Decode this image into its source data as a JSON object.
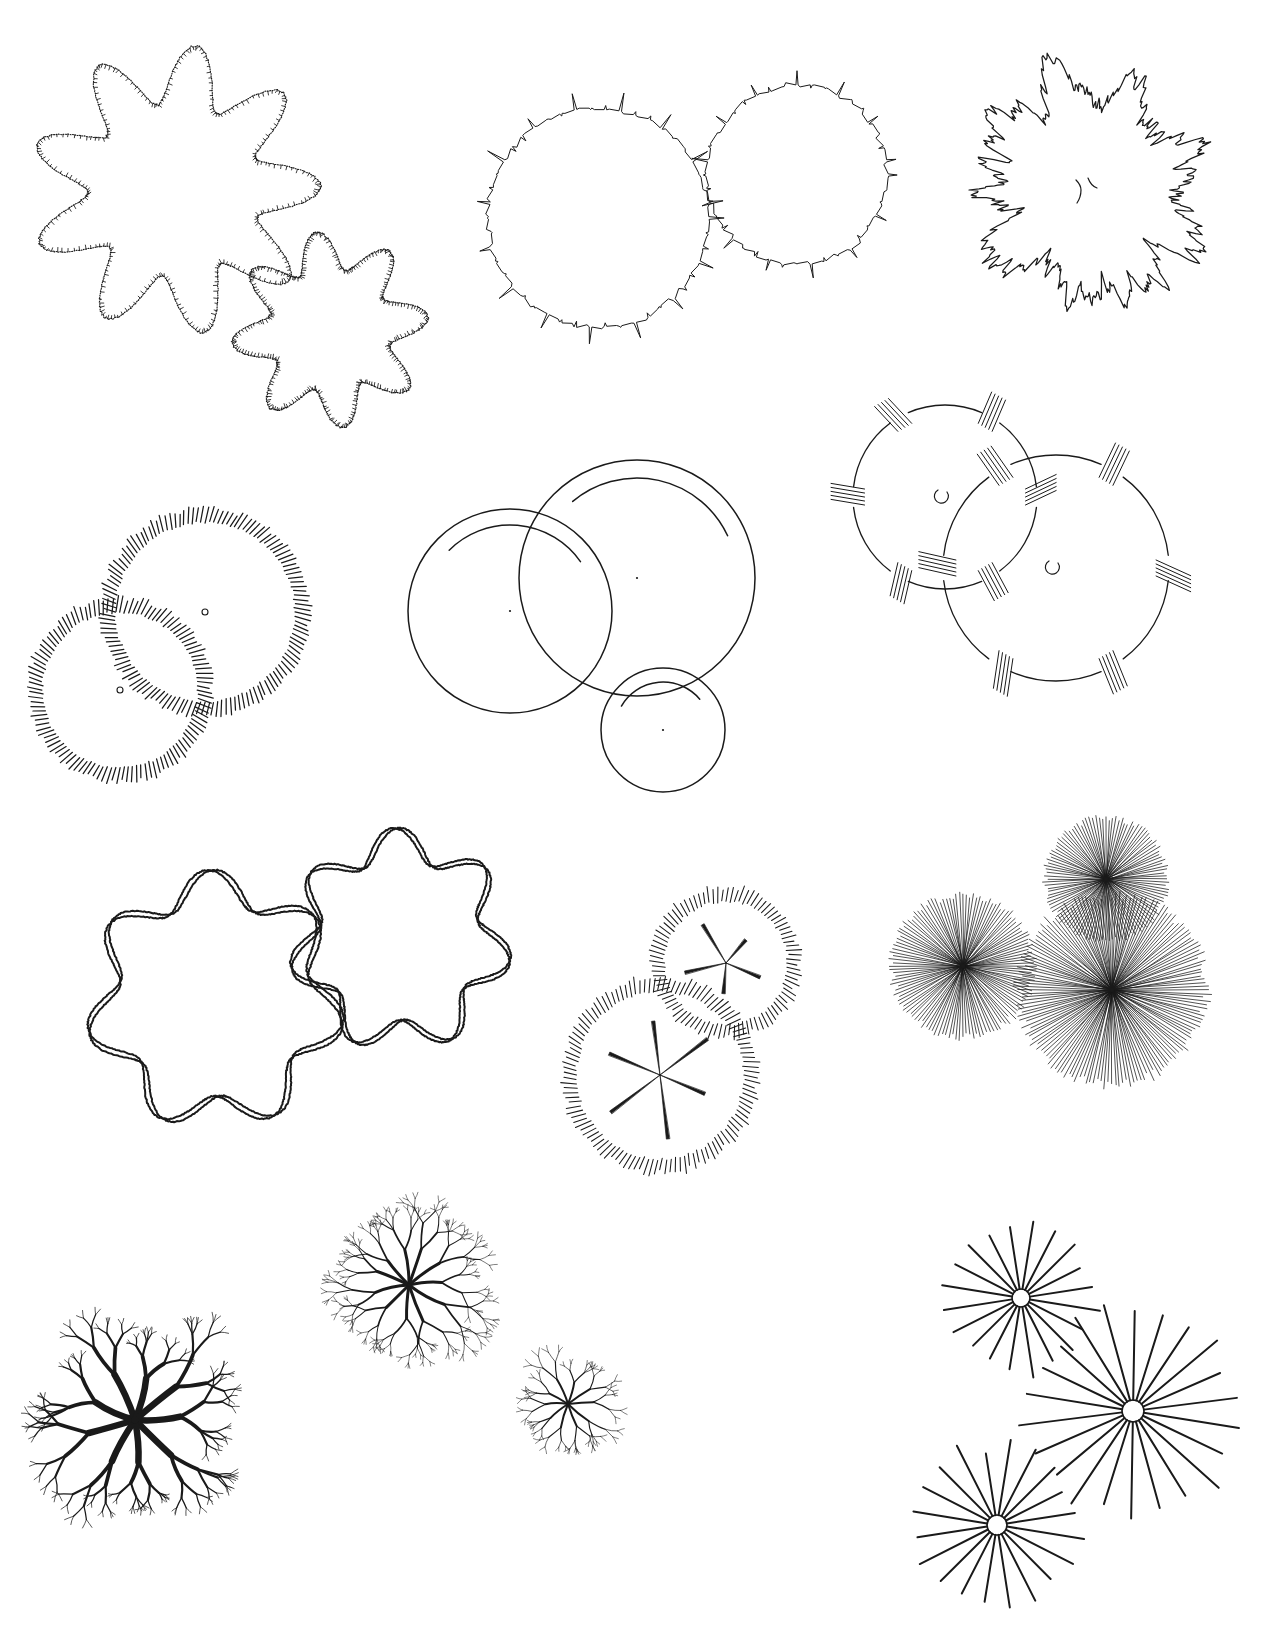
{
  "sheet": {
    "title": "Tree Symbols in Plan",
    "background_color": "#ffffff",
    "ink_color": "#1a1a1a",
    "width": 1275,
    "height": 1636,
    "footer_note": ""
  },
  "symbols": [
    {
      "id": "scalloped-stippled-cloud",
      "name": "Scalloped stippled canopy pair",
      "style": "stippled-scallop",
      "row": 1,
      "column": 1,
      "canopies": [
        {
          "cx": 175,
          "cy": 190,
          "r": 135,
          "lobes": 9,
          "lobe_depth": 0.14,
          "phase": 0.25
        },
        {
          "cx": 330,
          "cy": 330,
          "r": 92,
          "lobes": 8,
          "lobe_depth": 0.13,
          "phase": 1.1
        }
      ]
    },
    {
      "id": "spiky-jagged-canopy",
      "name": "Spiky jagged canopy pair",
      "style": "spiky",
      "row": 1,
      "column": 2,
      "canopies": [
        {
          "cx": 598,
          "cy": 218,
          "r": 110,
          "spikes": 46,
          "spike_len": 20,
          "jitter": 5
        },
        {
          "cx": 797,
          "cy": 175,
          "r": 90,
          "spikes": 40,
          "spike_len": 17,
          "jitter": 5
        }
      ]
    },
    {
      "id": "fractal-lobed-canopy",
      "name": "Fractal lobed canopy with trunk mark",
      "style": "fractal-outline",
      "row": 1,
      "column": 3,
      "canopies": [
        {
          "cx": 1087,
          "cy": 190,
          "r": 118,
          "lobes": 9,
          "lobe_depth": 0.3,
          "roughness": 4,
          "trunk_mark": true
        }
      ]
    },
    {
      "id": "comb-fringe-canopy",
      "name": "Comb fringe canopy pair with center dots",
      "style": "comb-fringe",
      "row": 2,
      "column": 1,
      "canopies": [
        {
          "cx": 205,
          "cy": 612,
          "r": 90,
          "ticks": 132,
          "tick_len": 14,
          "center_dot": true
        },
        {
          "cx": 120,
          "cy": 690,
          "r": 78,
          "ticks": 116,
          "tick_len": 14,
          "center_dot": true
        }
      ]
    },
    {
      "id": "plain-circle-shadow-arc",
      "name": "Plain circles with offset shade arc",
      "style": "plain-circle",
      "row": 2,
      "column": 2,
      "canopies": [
        {
          "cx": 510,
          "cy": 611,
          "r": 102,
          "center_dot": true,
          "arc_offset": 16,
          "arc_start": -135,
          "arc_end": -35
        },
        {
          "cx": 637,
          "cy": 578,
          "r": 118,
          "center_dot": true,
          "arc_offset": 18,
          "arc_start": -130,
          "arc_end": -25
        },
        {
          "cx": 663,
          "cy": 730,
          "r": 62,
          "center_dot": true,
          "arc_offset": 14,
          "arc_start": -150,
          "arc_end": -40
        }
      ]
    },
    {
      "id": "broken-arc-hatch-cluster",
      "name": "Broken arc canopy with hatch clusters",
      "style": "broken-arc-hatch",
      "row": 2,
      "column": 3,
      "canopies": [
        {
          "cx": 945,
          "cy": 497,
          "r": 92,
          "segments": 6,
          "cluster_lines": 5,
          "cluster_len": 34,
          "trunk_mark": true
        },
        {
          "cx": 1056,
          "cy": 568,
          "r": 113,
          "segments": 6,
          "cluster_lines": 5,
          "cluster_len": 38,
          "trunk_mark": true
        }
      ]
    },
    {
      "id": "sinusoidal-loop-canopy",
      "name": "Interwoven sinusoidal loop canopies",
      "style": "spirograph",
      "row": 3,
      "column": 1,
      "canopies": [
        {
          "cx": 215,
          "cy": 1000,
          "r": 113,
          "waves": 7,
          "amplitude": 17,
          "strands": 2
        },
        {
          "cx": 400,
          "cy": 940,
          "r": 96,
          "waves": 7,
          "amplitude": 16,
          "strands": 2
        }
      ]
    },
    {
      "id": "fringe-spoke-canopy",
      "name": "Fringe canopy with tapered spokes",
      "style": "fringe-spoke",
      "row": 3,
      "column": 2,
      "canopies": [
        {
          "cx": 726,
          "cy": 963,
          "r": 62,
          "ticks": 92,
          "tick_len": 13,
          "spokes": 5,
          "spoke_len": 40
        },
        {
          "cx": 660,
          "cy": 1075,
          "r": 84,
          "ticks": 118,
          "tick_len": 14,
          "spokes": 6,
          "spoke_len": 56
        }
      ]
    },
    {
      "id": "dense-sunburst-canopy",
      "name": "Dense sunburst canopy cluster",
      "style": "dense-burst",
      "row": 3,
      "column": 3,
      "canopies": [
        {
          "cx": 1106,
          "cy": 879,
          "r": 62,
          "rays": 116
        },
        {
          "cx": 963,
          "cy": 966,
          "r": 72,
          "rays": 128
        },
        {
          "cx": 1112,
          "cy": 990,
          "r": 96,
          "rays": 160
        }
      ]
    },
    {
      "id": "branching-tree-medium",
      "name": "Branching fractal tree, medium",
      "style": "branch-tree",
      "row": 4,
      "column": 1,
      "canopies": [
        {
          "cx": 409,
          "cy": 1285,
          "r": 90,
          "primary_branches": 11,
          "depth": 5,
          "trunk_width": 3.0
        }
      ]
    },
    {
      "id": "branching-tree-bold",
      "name": "Branching fractal tree, bold",
      "style": "branch-tree",
      "row": 4,
      "column": 1,
      "canopies": [
        {
          "cx": 135,
          "cy": 1420,
          "r": 118,
          "primary_branches": 9,
          "depth": 5,
          "trunk_width": 6.5
        }
      ]
    },
    {
      "id": "branching-tree-small",
      "name": "Branching fractal tree, small",
      "style": "branch-tree",
      "row": 4,
      "column": 2,
      "canopies": [
        {
          "cx": 568,
          "cy": 1404,
          "r": 62,
          "primary_branches": 10,
          "depth": 4,
          "trunk_width": 2.0
        }
      ]
    },
    {
      "id": "spoke-star-canopy",
      "name": "Open spoke star canopies",
      "style": "spoke-star",
      "row": 4,
      "column": 3,
      "canopies": [
        {
          "cx": 1021,
          "cy": 1298,
          "r": 76,
          "spokes": 20,
          "hub_r": 9
        },
        {
          "cx": 1133,
          "cy": 1411,
          "r": 110,
          "spokes": 22,
          "hub_r": 11
        },
        {
          "cx": 997,
          "cy": 1525,
          "r": 84,
          "spokes": 20,
          "hub_r": 10
        }
      ]
    }
  ]
}
